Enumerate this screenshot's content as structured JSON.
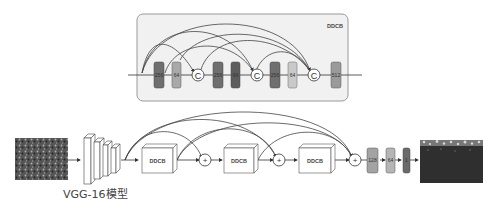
{
  "ddcb_detail": {
    "title": "DDCB",
    "layers": [
      {
        "label": "256",
        "shade": "#6f6f6f"
      },
      {
        "label": "64",
        "shade": "#a9a9a9"
      },
      {
        "label": "C",
        "type": "concat"
      },
      {
        "label": "256",
        "shade": "#6f6f6f"
      },
      {
        "label": "64",
        "shade": "#5d5d5d"
      },
      {
        "label": "C",
        "type": "concat"
      },
      {
        "label": "256",
        "shade": "#6f6f6f"
      },
      {
        "label": "64",
        "shade": "#c9c9c9"
      },
      {
        "label": "C",
        "type": "concat"
      },
      {
        "label": "512",
        "shade": "#9a9a9a"
      }
    ]
  },
  "pipeline": {
    "input_image": "crowd-photo",
    "backbone_label": "VGG-16模型",
    "blocks": [
      "DDCB",
      "DDCB",
      "DDCB"
    ],
    "sum_symbol": "+",
    "head_layers": [
      {
        "label": "128",
        "shade": "#a3a3a3"
      },
      {
        "label": "64",
        "shade": "#b5b5b5"
      },
      {
        "label": "1",
        "shade": "#6a6a6a"
      }
    ],
    "output_image": "density-map"
  }
}
